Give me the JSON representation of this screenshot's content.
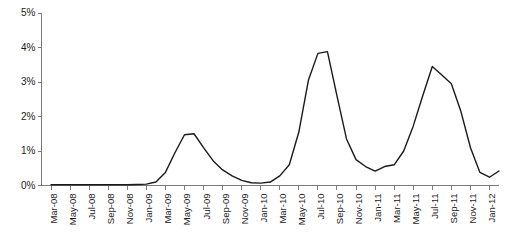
{
  "chart_data": {
    "type": "line",
    "title": "",
    "subtitle": "",
    "xlabel": "",
    "ylabel": "",
    "grid": false,
    "legend": "none",
    "ylim": [
      0,
      5
    ],
    "ytick_labels": [
      "0%",
      "1%",
      "2%",
      "3%",
      "4%",
      "5%"
    ],
    "ytick_values": [
      0,
      1,
      2,
      3,
      4,
      5
    ],
    "xtick_labels": [
      "Mar-08",
      "May-08",
      "Jul-08",
      "Sep-08",
      "Nov-08",
      "Jan-09",
      "Mar-09",
      "May-09",
      "Jul-09",
      "Sep-09",
      "Nov-09",
      "Jan-10",
      "Mar-10",
      "May-10",
      "Jul-10",
      "Sep-10",
      "Nov-10",
      "Jan-11",
      "Mar-11",
      "May-11",
      "Jul-11",
      "Sep-11",
      "Nov-11",
      "Jan-12"
    ],
    "series": [
      {
        "name": "series-1",
        "color": "#1a1a1a",
        "x": [
          "Mar-08",
          "Apr-08",
          "May-08",
          "Jun-08",
          "Jul-08",
          "Aug-08",
          "Sep-08",
          "Oct-08",
          "Nov-08",
          "Dec-08",
          "Jan-09",
          "Feb-09",
          "Mar-09",
          "Apr-09",
          "May-09",
          "Jun-09",
          "Jul-09",
          "Aug-09",
          "Sep-09",
          "Oct-09",
          "Nov-09",
          "Dec-09",
          "Jan-10",
          "Feb-10",
          "Mar-10",
          "Apr-10",
          "May-10",
          "Jun-10",
          "Jul-10",
          "Aug-10",
          "Sep-10",
          "Oct-10",
          "Nov-10",
          "Dec-10",
          "Jan-11",
          "Feb-11",
          "Mar-11",
          "Apr-11",
          "May-11",
          "Jun-11",
          "Jul-11",
          "Aug-11",
          "Sep-11",
          "Oct-11",
          "Nov-11",
          "Dec-11",
          "Jan-12",
          "Feb-12"
        ],
        "values": [
          0.02,
          0.02,
          0.02,
          0.02,
          0.02,
          0.02,
          0.02,
          0.02,
          0.02,
          0.03,
          0.04,
          0.1,
          0.38,
          0.95,
          1.47,
          1.5,
          1.1,
          0.72,
          0.45,
          0.28,
          0.15,
          0.08,
          0.07,
          0.1,
          0.28,
          0.6,
          1.55,
          3.05,
          3.83,
          3.88,
          2.6,
          1.35,
          0.75,
          0.55,
          0.42,
          0.55,
          0.6,
          1.0,
          1.72,
          2.6,
          3.45,
          3.2,
          2.95,
          2.15,
          1.1,
          0.38,
          0.24,
          0.42
        ]
      }
    ]
  }
}
